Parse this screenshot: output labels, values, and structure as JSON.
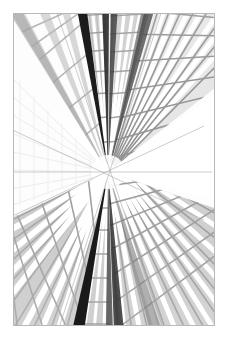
{
  "page": {
    "background_color": "#ffffff",
    "width": 228,
    "height": 338
  },
  "photo": {
    "title": "Skyscrapers looking up — one-point perspective",
    "description": "Black and white architectural photograph shot straight up between four glass office towers; window grids converge to a central vanishing point.",
    "orientation": "portrait",
    "palette": {
      "white": "#ffffff",
      "paper": "#fbfbfb",
      "border": "#b8b8b8",
      "near_black": "#141414",
      "dark": "#3a3a3a",
      "mid_dark": "#6e6e6e",
      "mid": "#9a9a9a",
      "light": "#c4c4c4",
      "pale": "#e2e2e2",
      "faint": "#f1f1f1"
    },
    "frame": {
      "left": 13,
      "top": 13,
      "width": 202,
      "height": 313,
      "border_width": 1
    },
    "vanishing_point": {
      "x": 0.47,
      "y": 0.51
    },
    "towers": [
      {
        "name": "tower-upper-left",
        "tone": "#c8c8c8",
        "window_rows": 14,
        "window_cols": 6
      },
      {
        "name": "tower-upper-center-left",
        "tone": "#9e9e9e",
        "window_rows": 12,
        "window_cols": 4
      },
      {
        "name": "tower-upper-center-right",
        "tone": "#b0b0b0",
        "window_rows": 12,
        "window_cols": 5
      },
      {
        "name": "tower-upper-right",
        "tone": "#8a8a8a",
        "window_rows": 16,
        "window_cols": 8
      },
      {
        "name": "tower-left-glass",
        "tone": "#f0f0f0",
        "window_rows": 20,
        "window_cols": 10
      },
      {
        "name": "tower-lower-left",
        "tone": "#b4b4b4",
        "window_rows": 13,
        "window_cols": 6
      },
      {
        "name": "tower-lower-center",
        "tone": "#6a6a6a",
        "window_rows": 12,
        "window_cols": 4
      },
      {
        "name": "tower-lower-right",
        "tone": "#a2a2a2",
        "window_rows": 15,
        "window_cols": 7
      }
    ]
  }
}
